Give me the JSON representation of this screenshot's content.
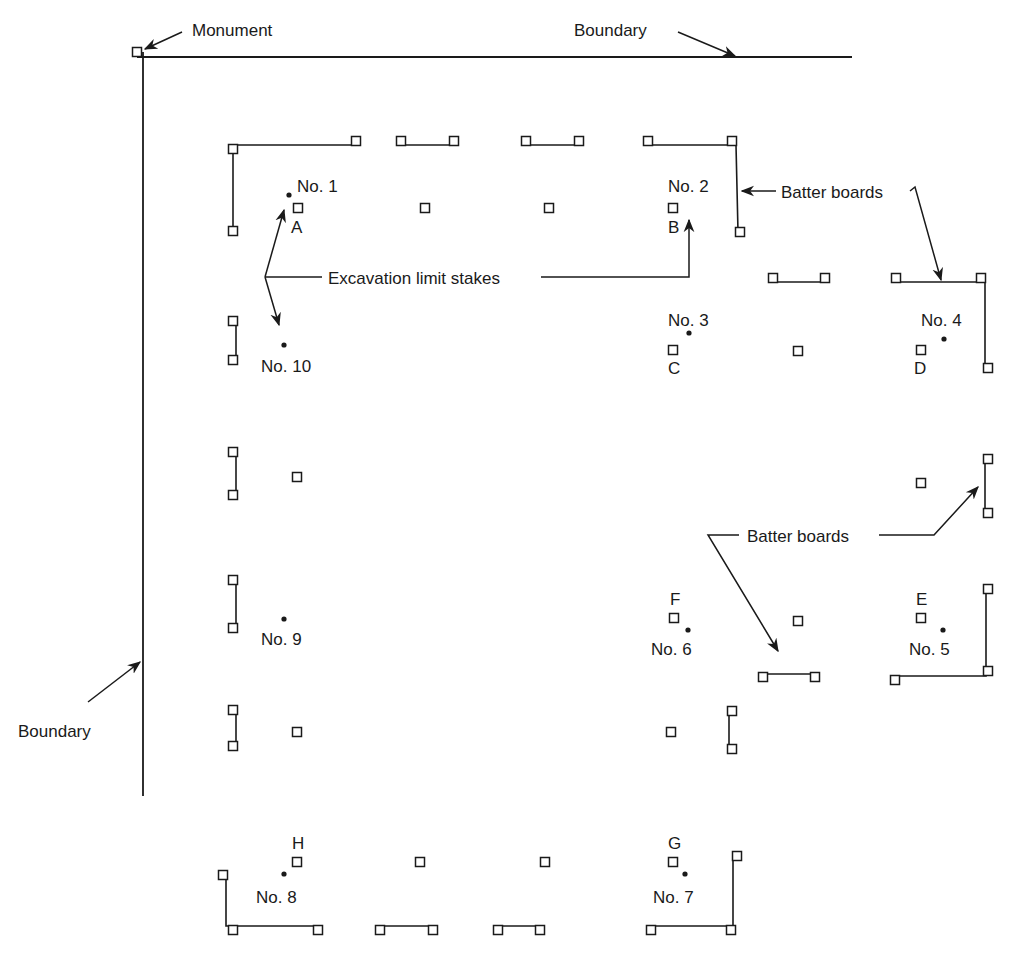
{
  "diagram": {
    "caption_partial": "Batter Boards in Plan",
    "colors": {
      "ink": "#1a1a1a",
      "background": "#ffffff"
    },
    "labels": {
      "monument": "Monument",
      "boundary_top": "Boundary",
      "boundary_left": "Boundary",
      "batter_boards_top": "Batter boards",
      "batter_boards_mid": "Batter boards",
      "excavation_limit_stakes": "Excavation limit stakes"
    },
    "boundary_lines": [
      {
        "id": "top",
        "x1": 137,
        "y1": 57,
        "x2": 852,
        "y2": 57
      },
      {
        "id": "left",
        "x1": 143,
        "y1": 52,
        "x2": 143,
        "y2": 796
      }
    ],
    "monument": {
      "x": 137,
      "y": 52
    },
    "corners": [
      {
        "number": "No. 1",
        "dot": [
          289,
          195
        ],
        "label_pos": [
          297,
          192
        ],
        "anchor": "start"
      },
      {
        "number": "No. 2",
        "dot": null,
        "label_pos": [
          668,
          192
        ],
        "anchor": "start"
      },
      {
        "number": "No. 3",
        "dot": [
          689,
          333
        ],
        "label_pos": [
          668,
          326
        ],
        "anchor": "start"
      },
      {
        "number": "No. 4",
        "dot": [
          944,
          339
        ],
        "label_pos": [
          921,
          326
        ],
        "anchor": "start"
      },
      {
        "number": "No. 5",
        "dot": [
          943,
          630
        ],
        "label_pos": [
          909,
          655
        ],
        "anchor": "start"
      },
      {
        "number": "No. 6",
        "dot": [
          688,
          630
        ],
        "label_pos": [
          651,
          655
        ],
        "anchor": "start"
      },
      {
        "number": "No. 7",
        "dot": [
          685,
          874
        ],
        "label_pos": [
          653,
          903
        ],
        "anchor": "start"
      },
      {
        "number": "No. 8",
        "dot": [
          284,
          874
        ],
        "label_pos": [
          256,
          903
        ],
        "anchor": "start"
      },
      {
        "number": "No. 9",
        "dot": [
          284,
          619
        ],
        "label_pos": [
          261,
          645
        ],
        "anchor": "start"
      },
      {
        "number": "No. 10",
        "dot": [
          284,
          345
        ],
        "label_pos": [
          261,
          372
        ],
        "anchor": "start"
      }
    ],
    "offset_stakes": [
      {
        "letter": "A",
        "stake": [
          298,
          208
        ],
        "label_pos": [
          291,
          233
        ]
      },
      {
        "letter": "B",
        "stake": [
          673,
          208
        ],
        "label_pos": [
          668,
          233
        ]
      },
      {
        "letter": "C",
        "stake": [
          673,
          350
        ],
        "label_pos": [
          668,
          374
        ]
      },
      {
        "letter": "D",
        "stake": [
          921,
          350
        ],
        "label_pos": [
          914,
          374
        ]
      },
      {
        "letter": "E",
        "stake": [
          921,
          618
        ],
        "label_pos": [
          916,
          605
        ]
      },
      {
        "letter": "F",
        "stake": [
          674,
          618
        ],
        "label_pos": [
          670,
          605
        ]
      },
      {
        "letter": "G",
        "stake": [
          673,
          862
        ],
        "label_pos": [
          668,
          849
        ]
      },
      {
        "letter": "H",
        "stake": [
          297,
          862
        ],
        "label_pos": [
          292,
          849
        ]
      }
    ],
    "intermediate_stakes": [
      [
        425,
        208
      ],
      [
        549,
        208
      ],
      [
        798,
        351
      ],
      [
        297,
        477
      ],
      [
        921,
        483
      ],
      [
        798,
        621
      ],
      [
        297,
        732
      ],
      [
        671,
        732
      ],
      [
        420,
        862
      ],
      [
        545,
        862
      ]
    ],
    "batter_boards": [
      {
        "id": "bb-nw",
        "path": [
          [
            233,
            149
          ],
          [
            233,
            145
          ],
          [
            356,
            145
          ]
        ],
        "stakes": [
          [
            233,
            149
          ],
          [
            356,
            141
          ],
          [
            233,
            231
          ]
        ],
        "vertical": [
          [
            233,
            149
          ],
          [
            233,
            231
          ]
        ]
      },
      {
        "id": "bb-n1",
        "path": [
          [
            401,
            145
          ],
          [
            454,
            145
          ]
        ],
        "stakes": [
          [
            401,
            141
          ],
          [
            454,
            141
          ]
        ]
      },
      {
        "id": "bb-n2",
        "path": [
          [
            526,
            145
          ],
          [
            579,
            145
          ]
        ],
        "stakes": [
          [
            526,
            141
          ],
          [
            579,
            141
          ]
        ]
      },
      {
        "id": "bb-ne2",
        "path": [
          [
            648,
            145
          ],
          [
            736,
            145
          ],
          [
            738,
            232
          ]
        ],
        "stakes": [
          [
            648,
            141
          ],
          [
            732,
            141
          ],
          [
            740,
            232
          ]
        ]
      },
      {
        "id": "bb-e1",
        "path": [
          [
            773,
            282
          ],
          [
            825,
            282
          ]
        ],
        "stakes": [
          [
            773,
            278
          ],
          [
            825,
            278
          ]
        ]
      },
      {
        "id": "bb-ne4",
        "path": [
          [
            896,
            282
          ],
          [
            985,
            282
          ],
          [
            985,
            368
          ]
        ],
        "stakes": [
          [
            896,
            278
          ],
          [
            981,
            278
          ],
          [
            988,
            368
          ]
        ]
      },
      {
        "id": "bb-w10",
        "path": [
          [
            236,
            321
          ],
          [
            236,
            360
          ]
        ],
        "stakes": [
          [
            233,
            321
          ],
          [
            233,
            360
          ]
        ]
      },
      {
        "id": "bb-e4b",
        "path": [
          [
            985,
            459
          ],
          [
            985,
            513
          ]
        ],
        "stakes": [
          [
            988,
            459
          ],
          [
            988,
            513
          ]
        ]
      },
      {
        "id": "bb-w9a",
        "path": [
          [
            236,
            452
          ],
          [
            236,
            495
          ]
        ],
        "stakes": [
          [
            233,
            452
          ],
          [
            233,
            495
          ]
        ]
      },
      {
        "id": "bb-w9b",
        "path": [
          [
            236,
            580
          ],
          [
            236,
            628
          ]
        ],
        "stakes": [
          [
            233,
            580
          ],
          [
            233,
            628
          ]
        ]
      },
      {
        "id": "bb-se5",
        "path": [
          [
            894,
            676
          ],
          [
            986,
            676
          ],
          [
            986,
            589
          ]
        ],
        "stakes": [
          [
            895,
            680
          ],
          [
            988,
            671
          ],
          [
            988,
            589
          ]
        ]
      },
      {
        "id": "bb-s6",
        "path": [
          [
            763,
            674
          ],
          [
            815,
            674
          ]
        ],
        "stakes": [
          [
            763,
            677
          ],
          [
            815,
            677
          ]
        ]
      },
      {
        "id": "bb-w8a",
        "path": [
          [
            236,
            710
          ],
          [
            236,
            746
          ]
        ],
        "stakes": [
          [
            233,
            710
          ],
          [
            233,
            746
          ]
        ]
      },
      {
        "id": "bb-e6",
        "path": [
          [
            729,
            711
          ],
          [
            729,
            749
          ]
        ],
        "stakes": [
          [
            732,
            711
          ],
          [
            732,
            749
          ]
        ]
      },
      {
        "id": "bb-sw8",
        "path": [
          [
            226,
            875
          ],
          [
            226,
            926
          ],
          [
            318,
            926
          ]
        ],
        "stakes": [
          [
            223,
            875
          ],
          [
            233,
            930
          ],
          [
            318,
            930
          ]
        ]
      },
      {
        "id": "bb-s1",
        "path": [
          [
            380,
            926
          ],
          [
            433,
            926
          ]
        ],
        "stakes": [
          [
            380,
            930
          ],
          [
            433,
            930
          ]
        ]
      },
      {
        "id": "bb-s2",
        "path": [
          [
            498,
            926
          ],
          [
            540,
            926
          ]
        ],
        "stakes": [
          [
            498,
            930
          ],
          [
            540,
            930
          ]
        ]
      },
      {
        "id": "bb-se7",
        "path": [
          [
            651,
            926
          ],
          [
            733,
            926
          ],
          [
            733,
            858
          ]
        ],
        "stakes": [
          [
            651,
            930
          ],
          [
            731,
            930
          ],
          [
            737,
            856
          ]
        ]
      }
    ]
  }
}
